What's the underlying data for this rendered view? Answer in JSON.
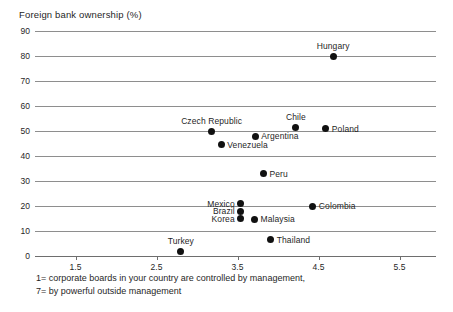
{
  "chart_data": {
    "type": "scatter",
    "title": "Foreign bank ownership (%)",
    "ylabel": "Foreign bank ownership (%)",
    "xlabel": "",
    "caption_lines": [
      "1= corporate boards in your country are controlled by management,",
      "7= by powerful outside management"
    ],
    "xlim": [
      1.0,
      5.95
    ],
    "ylim": [
      0,
      90
    ],
    "grid": true,
    "legend": "none",
    "yticks": [
      0,
      10,
      20,
      30,
      40,
      50,
      60,
      70,
      80,
      90
    ],
    "ytick_labels": [
      "0",
      "10",
      "20",
      "30",
      "40",
      "50",
      "60",
      "70",
      "80",
      "90"
    ],
    "xticks": [
      1.5,
      2.5,
      3.5,
      4.5,
      5.5
    ],
    "xtick_labels": [
      "1.5",
      "2.5",
      "3.5",
      "4.5",
      "5.5"
    ],
    "points": [
      {
        "label": "Hungary",
        "x": 4.68,
        "y": 80.0,
        "label_pos": "above"
      },
      {
        "label": "Czech Republic",
        "x": 3.18,
        "y": 50.0,
        "label_pos": "above"
      },
      {
        "label": "Chile",
        "x": 4.22,
        "y": 51.5,
        "label_pos": "above"
      },
      {
        "label": "Poland",
        "x": 4.59,
        "y": 51.0,
        "label_pos": "right"
      },
      {
        "label": "Argentina",
        "x": 3.72,
        "y": 48.0,
        "label_pos": "right"
      },
      {
        "label": "Venezuela",
        "x": 3.3,
        "y": 44.5,
        "label_pos": "right"
      },
      {
        "label": "Peru",
        "x": 3.82,
        "y": 33.0,
        "label_pos": "right"
      },
      {
        "label": "Mexico",
        "x": 3.54,
        "y": 21.0,
        "label_pos": "left"
      },
      {
        "label": "Brazil",
        "x": 3.54,
        "y": 18.0,
        "label_pos": "left"
      },
      {
        "label": "Korea",
        "x": 3.54,
        "y": 15.0,
        "label_pos": "left"
      },
      {
        "label": "Colombia",
        "x": 4.43,
        "y": 20.0,
        "label_pos": "right"
      },
      {
        "label": "Malaysia",
        "x": 3.71,
        "y": 14.8,
        "label_pos": "right"
      },
      {
        "label": "Thailand",
        "x": 3.91,
        "y": 6.5,
        "label_pos": "right"
      },
      {
        "label": "Turkey",
        "x": 2.8,
        "y": 2.0,
        "label_pos": "above"
      }
    ],
    "colors": {
      "marker": "#111111",
      "gridline": "#8e8e8e",
      "axis": "#6e6e6e",
      "text": "#1f1f1f",
      "background": "#ffffff"
    }
  }
}
